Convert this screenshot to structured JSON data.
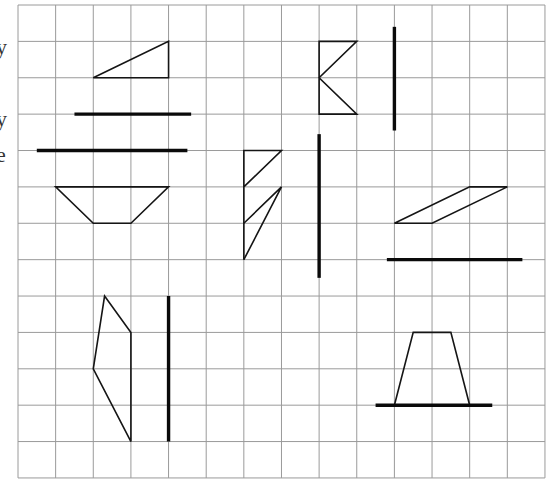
{
  "edge_glyphs": [
    {
      "text": "y",
      "top": 36
    },
    {
      "text": "y",
      "top": 108
    },
    {
      "text": "e",
      "top": 144
    }
  ],
  "grid": {
    "left": 18,
    "top": 5,
    "cell_w": 37.64,
    "cell_h": 36.38,
    "cols": 14,
    "rows": 13,
    "line_color": "#9a9a9a"
  },
  "shapes": [
    {
      "name": "right-triangle",
      "type": "polygon",
      "points": [
        [
          2,
          2
        ],
        [
          4,
          2
        ],
        [
          4,
          1
        ]
      ]
    },
    {
      "name": "trapezoid-inverted",
      "type": "polygon",
      "points": [
        [
          1,
          5
        ],
        [
          4,
          5
        ],
        [
          3,
          6
        ],
        [
          2,
          6
        ]
      ]
    },
    {
      "name": "notched-rectangle",
      "type": "polygon",
      "points": [
        [
          8,
          1
        ],
        [
          9,
          1
        ],
        [
          8,
          2
        ],
        [
          9,
          3
        ],
        [
          8,
          3
        ]
      ]
    },
    {
      "name": "zigzag-figure",
      "type": "polyline",
      "points": [
        [
          6,
          7
        ],
        [
          6,
          4
        ],
        [
          7,
          4
        ],
        [
          6,
          5
        ]
      ]
    },
    {
      "name": "zigzag-figure-lower",
      "type": "polyline",
      "points": [
        [
          6,
          6
        ],
        [
          7,
          5
        ],
        [
          6,
          7
        ]
      ]
    },
    {
      "name": "parallelogram",
      "type": "polygon",
      "points": [
        [
          10,
          6
        ],
        [
          11,
          6
        ],
        [
          13,
          5
        ],
        [
          12,
          5
        ]
      ]
    },
    {
      "name": "irregular-quadrilateral",
      "type": "polygon",
      "points": [
        [
          2.3,
          8
        ],
        [
          3,
          9
        ],
        [
          3,
          12
        ],
        [
          2,
          10
        ]
      ]
    },
    {
      "name": "trapezoid-upright",
      "type": "polygon",
      "points": [
        [
          10.5,
          9
        ],
        [
          11.5,
          9
        ],
        [
          12,
          11
        ],
        [
          10,
          11
        ]
      ]
    }
  ],
  "axes_of_symmetry": [
    {
      "name": "axis-horizontal-1",
      "from": [
        1.5,
        3
      ],
      "to": [
        4.6,
        3
      ]
    },
    {
      "name": "axis-horizontal-2",
      "from": [
        0.5,
        4
      ],
      "to": [
        4.5,
        4
      ]
    },
    {
      "name": "axis-vertical-1",
      "from": [
        10,
        0.6
      ],
      "to": [
        10,
        3.45
      ]
    },
    {
      "name": "axis-vertical-2",
      "from": [
        8,
        3.55
      ],
      "to": [
        8,
        7.5
      ]
    },
    {
      "name": "axis-horizontal-3",
      "from": [
        9.8,
        7
      ],
      "to": [
        13.4,
        7
      ]
    },
    {
      "name": "axis-vertical-3",
      "from": [
        4,
        8
      ],
      "to": [
        4,
        12
      ]
    },
    {
      "name": "axis-horizontal-4",
      "from": [
        9.5,
        11
      ],
      "to": [
        12.6,
        11
      ]
    }
  ]
}
